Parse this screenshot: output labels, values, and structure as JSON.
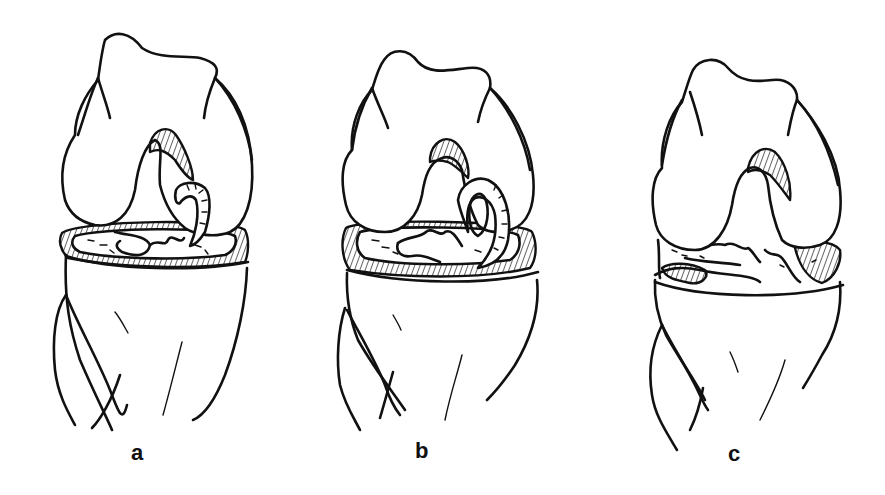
{
  "figure": {
    "background_color": "#ffffff",
    "line_color": "#111111",
    "panels": [
      {
        "id": "a",
        "label": "a",
        "label_x": 130,
        "label_y": 442,
        "finding": "meniscus with displaced flap curling into notch"
      },
      {
        "id": "b",
        "label": "b",
        "label_x": 414,
        "label_y": 442,
        "finding": "bucket-handle meniscal tear displaced into notch"
      },
      {
        "id": "c",
        "label": "c",
        "label_x": 728,
        "label_y": 445,
        "finding": "degenerative / complex meniscal tearing"
      }
    ]
  }
}
